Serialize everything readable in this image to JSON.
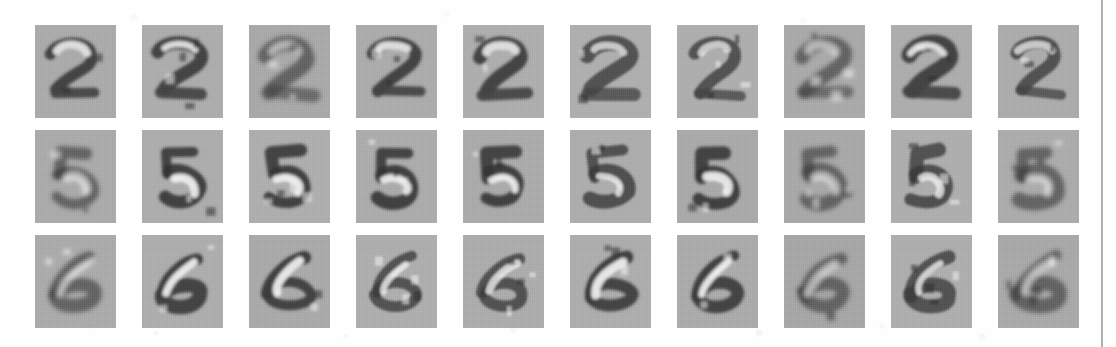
{
  "figure": {
    "kind": "image-grid",
    "background_color": "#fefefe",
    "tile_background_color": "#a9a9a9",
    "rule_color": "#9a9a9a",
    "rows": 3,
    "columns": 10,
    "tile_width": 81,
    "tile_height": 93,
    "column_gap": 26,
    "row_gap": 12,
    "grid_origin_x": 35,
    "grid_origin_y": 25
  },
  "chart_data": {
    "type": "heatmap",
    "title": "",
    "subtitle": "",
    "xlabel": "",
    "ylabel": "",
    "legend": [],
    "grid": false,
    "rows": 3,
    "columns": 10,
    "row_labels": [
      "2",
      "5",
      "6"
    ],
    "column_labels": [
      "1",
      "2",
      "3",
      "4",
      "5",
      "6",
      "7",
      "8",
      "9",
      "10"
    ],
    "colormap": "grayscale",
    "value_range": [
      0,
      1
    ]
  },
  "tiles": [
    {
      "row": 0,
      "col": 0,
      "digit": "2",
      "variant": "blob-2",
      "tone": "#a9a9a9"
    },
    {
      "row": 0,
      "col": 1,
      "digit": "2",
      "variant": "stroke-2",
      "tone": "#ababab"
    },
    {
      "row": 0,
      "col": 2,
      "digit": "2",
      "variant": "edge-2",
      "tone": "#a7a7a7"
    },
    {
      "row": 0,
      "col": 3,
      "digit": "2",
      "variant": "blob-2",
      "tone": "#aaaaaa"
    },
    {
      "row": 0,
      "col": 4,
      "digit": "2",
      "variant": "stroke-2",
      "tone": "#acacac"
    },
    {
      "row": 0,
      "col": 5,
      "digit": "2",
      "variant": "thin-2",
      "tone": "#adadad"
    },
    {
      "row": 0,
      "col": 6,
      "digit": "2",
      "variant": "thin-2",
      "tone": "#acacac"
    },
    {
      "row": 0,
      "col": 7,
      "digit": "2",
      "variant": "edge-2",
      "tone": "#a8a8a8"
    },
    {
      "row": 0,
      "col": 8,
      "digit": "2",
      "variant": "stroke-2",
      "tone": "#ababab"
    },
    {
      "row": 0,
      "col": 9,
      "digit": "2",
      "variant": "thin-2",
      "tone": "#aaaaaa"
    },
    {
      "row": 1,
      "col": 0,
      "digit": "5",
      "variant": "edge-5",
      "tone": "#a9a9a9"
    },
    {
      "row": 1,
      "col": 1,
      "digit": "5",
      "variant": "solid-5",
      "tone": "#ababab"
    },
    {
      "row": 1,
      "col": 2,
      "digit": "5",
      "variant": "solid-5",
      "tone": "#acacac"
    },
    {
      "row": 1,
      "col": 3,
      "digit": "5",
      "variant": "solid-5",
      "tone": "#aaaaaa"
    },
    {
      "row": 1,
      "col": 4,
      "digit": "5",
      "variant": "solid-5",
      "tone": "#a9a9a9"
    },
    {
      "row": 1,
      "col": 5,
      "digit": "5",
      "variant": "thin-5",
      "tone": "#ababab"
    },
    {
      "row": 1,
      "col": 6,
      "digit": "5",
      "variant": "solid-5",
      "tone": "#a8a8a8"
    },
    {
      "row": 1,
      "col": 7,
      "digit": "5",
      "variant": "edge-5",
      "tone": "#a7a7a7"
    },
    {
      "row": 1,
      "col": 8,
      "digit": "5",
      "variant": "thin-5",
      "tone": "#acacac"
    },
    {
      "row": 1,
      "col": 9,
      "digit": "5",
      "variant": "edge-5",
      "tone": "#aaaaaa"
    },
    {
      "row": 2,
      "col": 0,
      "digit": "6",
      "variant": "edge-6",
      "tone": "#a9a9a9"
    },
    {
      "row": 2,
      "col": 1,
      "digit": "6",
      "variant": "solid-6",
      "tone": "#ababab"
    },
    {
      "row": 2,
      "col": 2,
      "digit": "6",
      "variant": "solid-6",
      "tone": "#a8a8a8"
    },
    {
      "row": 2,
      "col": 3,
      "digit": "6",
      "variant": "thin-6",
      "tone": "#acacac"
    },
    {
      "row": 2,
      "col": 4,
      "digit": "6",
      "variant": "thin-6",
      "tone": "#aaaaaa"
    },
    {
      "row": 2,
      "col": 5,
      "digit": "6",
      "variant": "solid-6",
      "tone": "#ababab"
    },
    {
      "row": 2,
      "col": 6,
      "digit": "6",
      "variant": "solid-6",
      "tone": "#a9a9a9"
    },
    {
      "row": 2,
      "col": 7,
      "digit": "6",
      "variant": "edge-6",
      "tone": "#a5a5a5"
    },
    {
      "row": 2,
      "col": 8,
      "digit": "6",
      "variant": "thin-6",
      "tone": "#acacac"
    },
    {
      "row": 2,
      "col": 9,
      "digit": "6",
      "variant": "edge-6",
      "tone": "#a7a7a7"
    }
  ]
}
